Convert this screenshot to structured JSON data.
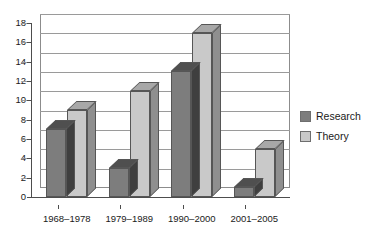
{
  "chart_data": {
    "type": "bar",
    "title": "",
    "subtitle": "",
    "xlabel": "",
    "ylabel": "",
    "categories": [
      "1968–1978",
      "1979–1989",
      "1990–2000",
      "2001–2005"
    ],
    "series": [
      {
        "name": "Research",
        "color": "#7d7d7d",
        "values": [
          7,
          3,
          13,
          1
        ]
      },
      {
        "name": "Theory",
        "color": "#c9c9c9",
        "values": [
          9,
          11,
          17,
          5
        ]
      }
    ],
    "ylim": [
      0,
      18
    ],
    "ytick_step": 2,
    "yticks": [
      0,
      2,
      4,
      6,
      8,
      10,
      12,
      14,
      16,
      18
    ],
    "grid": true,
    "legend_position": "right",
    "style": "3d-column"
  },
  "legend": {
    "items": [
      {
        "label": "Research",
        "swatch": "research"
      },
      {
        "label": "Theory",
        "swatch": "theory"
      }
    ]
  }
}
